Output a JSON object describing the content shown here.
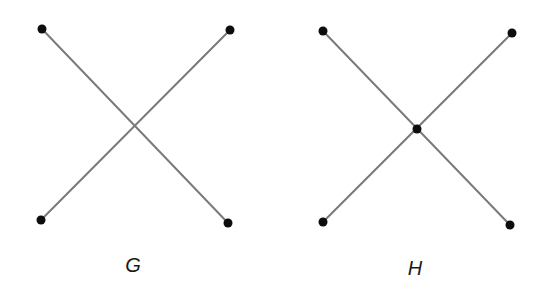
{
  "figures": [
    {
      "label": "G",
      "label_pos": [
        133,
        265
      ],
      "edges": [
        [
          [
            42,
            29
          ],
          [
            228,
            223
          ]
        ],
        [
          [
            41,
            220
          ],
          [
            230,
            30
          ]
        ]
      ],
      "vertices": [
        [
          42,
          29
        ],
        [
          230,
          30
        ],
        [
          41,
          220
        ],
        [
          228,
          223
        ]
      ]
    },
    {
      "label": "H",
      "label_pos": [
        415,
        268
      ],
      "edges": [
        [
          [
            323,
            31
          ],
          [
            510,
            225
          ]
        ],
        [
          [
            323,
            222
          ],
          [
            512,
            33
          ]
        ]
      ],
      "vertices": [
        [
          323,
          31
        ],
        [
          512,
          33
        ],
        [
          323,
          222
        ],
        [
          510,
          225
        ],
        [
          417,
          129
        ]
      ]
    }
  ],
  "colors": {
    "edge": "#7a7a7a",
    "vertex": "#0d0d0d",
    "background": "#ffffff"
  },
  "vertex_radius": 4.5
}
